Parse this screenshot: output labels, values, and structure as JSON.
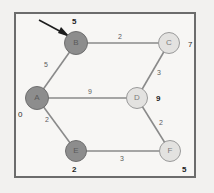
{
  "diagram": {
    "frame": {
      "border_color": "#6c6c6c",
      "background": "#f7f6f4"
    },
    "pointer": {
      "name": "arrow-pointer",
      "target": "B"
    },
    "nodes": [
      {
        "id": "A",
        "label": "A",
        "x": 37,
        "y": 98,
        "r": 12,
        "state": "visited",
        "dist": "0",
        "dist_x": 18,
        "dist_y": 111,
        "dist_bold": false
      },
      {
        "id": "B",
        "label": "B",
        "x": 76,
        "y": 43,
        "r": 12,
        "state": "visited",
        "dist": "5",
        "dist_x": 72,
        "dist_y": 22,
        "dist_bold": true
      },
      {
        "id": "C",
        "label": "C",
        "x": 169,
        "y": 43,
        "r": 11,
        "state": "unvisited",
        "dist": "7",
        "dist_x": 188,
        "dist_y": 45,
        "dist_bold": false
      },
      {
        "id": "D",
        "label": "D",
        "x": 137,
        "y": 98,
        "r": 11,
        "state": "unvisited",
        "dist": "9",
        "dist_x": 156,
        "dist_y": 100,
        "dist_bold": true
      },
      {
        "id": "E",
        "label": "E",
        "x": 76,
        "y": 151,
        "r": 11,
        "state": "visited",
        "dist": "2",
        "dist_x": 72,
        "dist_y": 170,
        "dist_bold": true
      },
      {
        "id": "F",
        "label": "F",
        "x": 170,
        "y": 151,
        "r": 11,
        "state": "unvisited",
        "dist": "5",
        "dist_x": 182,
        "dist_y": 170,
        "dist_bold": true
      }
    ],
    "edges": [
      {
        "from": "A",
        "to": "B",
        "weight": "5",
        "label_x": 46,
        "label_y": 64
      },
      {
        "from": "B",
        "to": "C",
        "weight": "2",
        "label_x": 118,
        "label_y": 36
      },
      {
        "from": "A",
        "to": "D",
        "weight": "9",
        "label_x": 88,
        "label_y": 91
      },
      {
        "from": "C",
        "to": "D",
        "weight": "3",
        "label_x": 157,
        "label_y": 72
      },
      {
        "from": "A",
        "to": "E",
        "weight": "2",
        "label_x": 46,
        "label_y": 119
      },
      {
        "from": "D",
        "to": "F",
        "weight": "2",
        "label_x": 159,
        "label_y": 122
      },
      {
        "from": "E",
        "to": "F",
        "weight": "3",
        "label_x": 120,
        "label_y": 158
      }
    ]
  }
}
